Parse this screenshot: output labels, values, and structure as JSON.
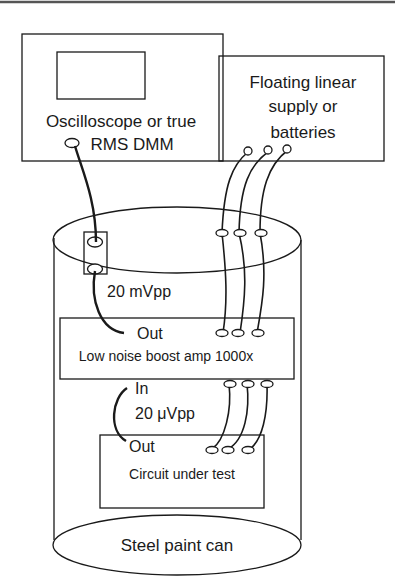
{
  "figure": {
    "type": "test-setup-diagram",
    "top_rule": true
  },
  "instrument": {
    "line1": "Oscilloscope or true",
    "line2": "RMS DMM",
    "has_screen": true
  },
  "supply": {
    "line1": "Floating linear",
    "line2": "supply or",
    "line3": "batteries",
    "terminal_count": 3
  },
  "enclosure": {
    "label": "Steel paint can",
    "feedthrough": "BNC feedthrough (2 jacks)"
  },
  "signal_out": {
    "level": "20 mVpp"
  },
  "amplifier": {
    "out_label": "Out",
    "label": "Low noise boost amp 1000x",
    "in_label": "In",
    "power_terminals": 3
  },
  "signal_in": {
    "level": "20 μVpp"
  },
  "dut": {
    "out_label": "Out",
    "label": "Circuit under test",
    "power_terminals": 3
  }
}
